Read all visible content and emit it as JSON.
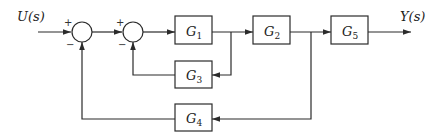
{
  "diagram": {
    "type": "block-diagram",
    "input": {
      "label": "U(s)"
    },
    "output": {
      "label": "Y(s)"
    },
    "summing_junctions": [
      {
        "id": "sum1",
        "signs": {
          "top_left": "+",
          "bottom_left": "−"
        }
      },
      {
        "id": "sum2",
        "signs": {
          "top_left": "+",
          "bottom_left": "−"
        }
      }
    ],
    "blocks": [
      {
        "id": "G1",
        "base": "G",
        "sub": "1"
      },
      {
        "id": "G2",
        "base": "G",
        "sub": "2"
      },
      {
        "id": "G3",
        "base": "G",
        "sub": "3"
      },
      {
        "id": "G4",
        "base": "G",
        "sub": "4"
      },
      {
        "id": "G5",
        "base": "G",
        "sub": "5"
      }
    ],
    "connections": [
      {
        "from": "U(s)",
        "to": "sum1",
        "sign": "+"
      },
      {
        "from": "sum1",
        "to": "sum2",
        "sign": "+"
      },
      {
        "from": "sum2",
        "to": "G1"
      },
      {
        "from": "G1",
        "to": "G2"
      },
      {
        "from": "G1-output",
        "to": "G3",
        "note": "feedback branch"
      },
      {
        "from": "G3",
        "to": "sum2",
        "sign": "−"
      },
      {
        "from": "G2",
        "to": "G5"
      },
      {
        "from": "G2-output",
        "to": "G4",
        "note": "feedback branch"
      },
      {
        "from": "G4",
        "to": "sum1",
        "sign": "−"
      },
      {
        "from": "G5",
        "to": "Y(s)"
      }
    ]
  }
}
